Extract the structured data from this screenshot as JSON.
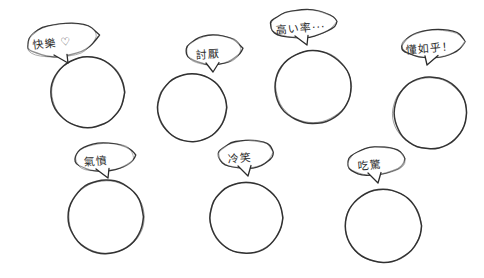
{
  "page": {
    "background_color": "#ffffff",
    "ink_color": "#2b2b2b",
    "width": 484,
    "height": 278,
    "style": "hand-drawn sketch, blank circular faces with speech bubbles"
  },
  "items": [
    {
      "id": "happy",
      "bubble_text": "快樂 ♡",
      "word": "快樂",
      "symbol": "♡",
      "meaning": "happy",
      "bubble": {
        "cx": 62,
        "cy": 40,
        "rx": 36,
        "ry": 17,
        "tail_x": 68,
        "tail_y": 57,
        "text_x": 32,
        "text_y": 34,
        "font_size": 11,
        "rotate": -7
      },
      "face": {
        "cx": 88,
        "cy": 92,
        "r": 37
      }
    },
    {
      "id": "dislike",
      "bubble_text": "討厭",
      "word": "討厭",
      "symbol": "",
      "meaning": "dislike / annoying",
      "bubble": {
        "cx": 214,
        "cy": 50,
        "rx": 28,
        "ry": 15,
        "tail_x": 213,
        "tail_y": 66,
        "text_x": 196,
        "text_y": 45,
        "font_size": 11,
        "rotate": -3
      },
      "face": {
        "cx": 192,
        "cy": 108,
        "r": 35
      }
    },
    {
      "id": "expensive",
      "bubble_text": "高い率···",
      "word": "高い率",
      "symbol": "···",
      "meaning": "high rate ...",
      "bubble": {
        "cx": 303,
        "cy": 24,
        "rx": 33,
        "ry": 14,
        "tail_x": 307,
        "tail_y": 39,
        "text_x": 276,
        "text_y": 19,
        "font_size": 11,
        "rotate": -4
      },
      "face": {
        "cx": 313,
        "cy": 87,
        "r": 38
      }
    },
    {
      "id": "whatever",
      "bubble_text": "懂如乎！",
      "word": "懂如乎",
      "symbol": "！",
      "meaning": "who cares!",
      "bubble": {
        "cx": 433,
        "cy": 44,
        "rx": 32,
        "ry": 14,
        "tail_x": 427,
        "tail_y": 59,
        "text_x": 406,
        "text_y": 39,
        "font_size": 11,
        "rotate": -4
      },
      "face": {
        "cx": 430,
        "cy": 113,
        "r": 37
      }
    },
    {
      "id": "angry",
      "bubble_text": "氣憤",
      "word": "氣憤",
      "symbol": "",
      "meaning": "angry / indignant",
      "bubble": {
        "cx": 104,
        "cy": 157,
        "rx": 30,
        "ry": 14,
        "tail_x": 108,
        "tail_y": 172,
        "text_x": 84,
        "text_y": 152,
        "font_size": 11,
        "rotate": -4
      },
      "face": {
        "cx": 106,
        "cy": 217,
        "r": 38
      }
    },
    {
      "id": "sneer",
      "bubble_text": "冷笑",
      "word": "冷笑",
      "symbol": "",
      "meaning": "cold smile / sneer",
      "bubble": {
        "cx": 246,
        "cy": 154,
        "rx": 28,
        "ry": 14,
        "tail_x": 248,
        "tail_y": 170,
        "text_x": 228,
        "text_y": 149,
        "font_size": 11,
        "rotate": -4
      },
      "face": {
        "cx": 246,
        "cy": 218,
        "r": 37
      }
    },
    {
      "id": "surprised",
      "bubble_text": "吃驚",
      "word": "吃驚",
      "symbol": "",
      "meaning": "surprised / shocked",
      "bubble": {
        "cx": 376,
        "cy": 161,
        "rx": 29,
        "ry": 14,
        "tail_x": 378,
        "tail_y": 177,
        "text_x": 358,
        "text_y": 156,
        "font_size": 11,
        "rotate": -5
      },
      "face": {
        "cx": 383,
        "cy": 226,
        "r": 38
      }
    }
  ]
}
